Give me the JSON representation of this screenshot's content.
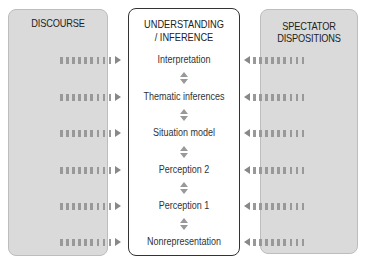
{
  "left_panel": {
    "title": "DISCOURSE"
  },
  "center_panel": {
    "title_line1": "UNDERSTANDING",
    "title_line2": "/ INFERENCE",
    "levels": [
      "Interpretation",
      "Thematic inferences",
      "Situation model",
      "Perception 2",
      "Perception 1",
      "Nonrepresentation"
    ]
  },
  "right_panel": {
    "title_line1": "SPECTATOR",
    "title_line2": "DISPOSITIONS"
  },
  "colors": {
    "side_fill": "#dadada",
    "arrow": "#999999",
    "center_border": "#333333"
  }
}
